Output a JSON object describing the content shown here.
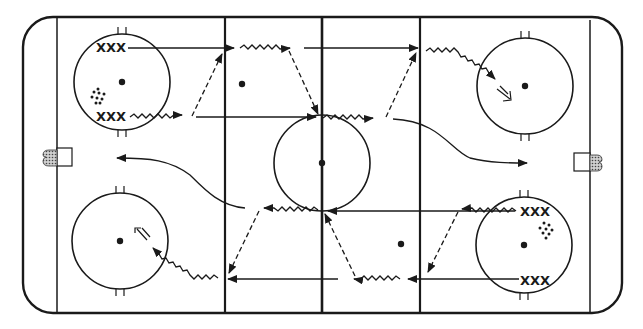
{
  "diagram": {
    "type": "ice-hockey-rink",
    "colors": {
      "ink": "#1a1a1a",
      "background": "#ffffff",
      "net_fill": "#888888"
    },
    "player_groups": [
      {
        "label": "XXX",
        "zone": "left",
        "position": "top-faceoff-circle"
      },
      {
        "label": "XXX",
        "zone": "left",
        "position": "bottom-faceoff-circle"
      },
      {
        "label": "XXX",
        "zone": "right",
        "position": "top-faceoff-circle"
      },
      {
        "label": "XXX",
        "zone": "right",
        "position": "bottom-faceoff-circle"
      }
    ],
    "puck_piles": [
      {
        "zone": "left",
        "icon": "puck-pile-icon"
      },
      {
        "zone": "right",
        "icon": "puck-pile-icon"
      }
    ],
    "legend": {
      "solid_arrow": "skate",
      "wavy_arrow": "skate with puck",
      "dashed_arrow": "pass",
      "double_arrow": "shot"
    }
  }
}
